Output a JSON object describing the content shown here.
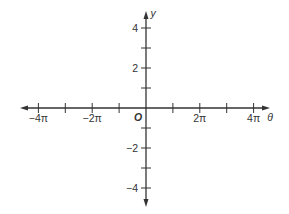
{
  "chart_data": {
    "type": "line",
    "title": "",
    "xlabel": "θ",
    "ylabel": "y",
    "origin_label": "O",
    "xlim": [
      -4.6,
      4.4
    ],
    "ylim": [
      -4.9,
      5.2
    ],
    "x_ticks": [
      -4,
      -3,
      -2,
      -1,
      1,
      2,
      3,
      4
    ],
    "x_tick_unit": "π",
    "x_tick_labels": [
      {
        "value": -4,
        "label": "−4π"
      },
      {
        "value": -2,
        "label": "−2π"
      },
      {
        "value": 2,
        "label": "2π"
      },
      {
        "value": 4,
        "label": "4π"
      }
    ],
    "y_ticks": [
      -4,
      -3,
      -2,
      -1,
      1,
      2,
      3,
      4
    ],
    "y_tick_labels": [
      {
        "value": 4,
        "label": "4"
      },
      {
        "value": 2,
        "label": "2"
      },
      {
        "value": -2,
        "label": "−2"
      },
      {
        "value": -4,
        "label": "−4"
      }
    ],
    "grid": false,
    "series": []
  },
  "colors": {
    "axis": "#333333",
    "background": "#ffffff"
  }
}
